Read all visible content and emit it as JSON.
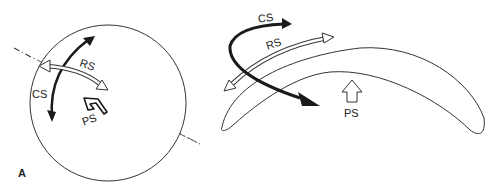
{
  "panel_a": {
    "label": "A",
    "cs_label": "CS",
    "rs_label": "RS",
    "ps_label": "PS"
  },
  "panel_b": {
    "cs_label": "CS",
    "rs_label": "RS",
    "ps_label": "PS"
  },
  "colors": {
    "line": "#333333",
    "arrow_fill": "#1a1a1a",
    "background": "#ffffff"
  }
}
